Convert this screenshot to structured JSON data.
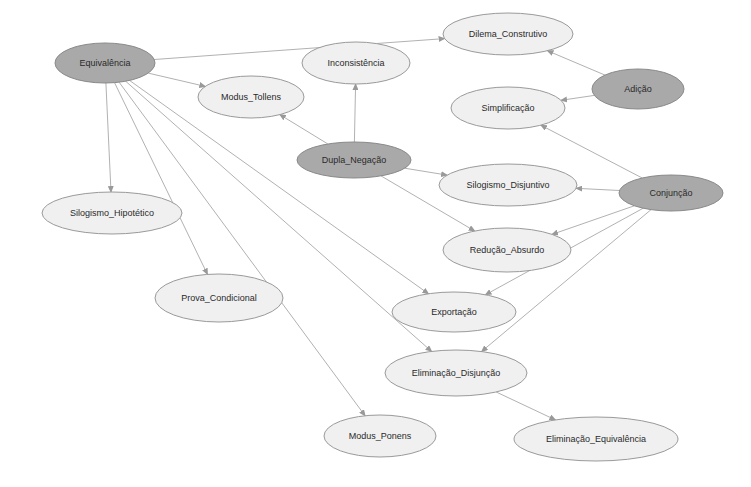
{
  "diagram": {
    "type": "directed-graph",
    "colors": {
      "central_node_fill": "#a9a9a9",
      "leaf_node_fill": "#f0f0f0",
      "edge": "#a8a8a8",
      "label": "#2a2a2a"
    },
    "nodes": [
      {
        "id": "equivalencia",
        "label": "Equivalência",
        "cx": 105,
        "cy": 63,
        "rx": 50,
        "ry": 20,
        "style": "dark"
      },
      {
        "id": "dilema_construtivo",
        "label": "Dilema_Construtivo",
        "cx": 508,
        "cy": 34,
        "rx": 65,
        "ry": 21,
        "style": "light"
      },
      {
        "id": "inconsistencia",
        "label": "Inconsistência",
        "cx": 356,
        "cy": 63,
        "rx": 54,
        "ry": 21,
        "style": "light"
      },
      {
        "id": "modus_tollens",
        "label": "Modus_Tollens",
        "cx": 251,
        "cy": 97,
        "rx": 53,
        "ry": 21,
        "style": "light"
      },
      {
        "id": "adicao",
        "label": "Adição",
        "cx": 638,
        "cy": 89,
        "rx": 46,
        "ry": 20,
        "style": "dark"
      },
      {
        "id": "simplificacao",
        "label": "Simplificação",
        "cx": 508,
        "cy": 108,
        "rx": 57,
        "ry": 21,
        "style": "light"
      },
      {
        "id": "dupla_negacao",
        "label": "Dupla_Negação",
        "cx": 354,
        "cy": 160,
        "rx": 57,
        "ry": 18,
        "style": "dark"
      },
      {
        "id": "silogismo_disjuntivo",
        "label": "Silogismo_Disjuntivo",
        "cx": 508,
        "cy": 185,
        "rx": 69,
        "ry": 21,
        "style": "light"
      },
      {
        "id": "conjuncao",
        "label": "Conjunção",
        "cx": 671,
        "cy": 193,
        "rx": 52,
        "ry": 18,
        "style": "dark"
      },
      {
        "id": "silogismo_hipotetico",
        "label": "Silogismo_Hipotético",
        "cx": 112,
        "cy": 213,
        "rx": 70,
        "ry": 21,
        "style": "light"
      },
      {
        "id": "reducao_absurdo",
        "label": "Redução_Absurdo",
        "cx": 507,
        "cy": 250,
        "rx": 64,
        "ry": 22,
        "style": "light"
      },
      {
        "id": "prova_condicional",
        "label": "Prova_Condicional",
        "cx": 219,
        "cy": 298,
        "rx": 64,
        "ry": 24,
        "style": "light"
      },
      {
        "id": "exportacao",
        "label": "Exportação",
        "cx": 454,
        "cy": 312,
        "rx": 62,
        "ry": 20,
        "style": "light"
      },
      {
        "id": "eliminacao_disjuncao",
        "label": "Eliminação_Disjunção",
        "cx": 456,
        "cy": 373,
        "rx": 71,
        "ry": 23,
        "style": "light"
      },
      {
        "id": "modus_ponens",
        "label": "Modus_Ponens",
        "cx": 380,
        "cy": 436,
        "rx": 56,
        "ry": 21,
        "style": "light"
      },
      {
        "id": "eliminacao_equivalencia",
        "label": "Eliminação_Equivalência",
        "cx": 596,
        "cy": 439,
        "rx": 82,
        "ry": 22,
        "style": "light"
      }
    ],
    "edges": [
      {
        "from": "equivalencia",
        "to": "dilema_construtivo"
      },
      {
        "from": "equivalencia",
        "to": "modus_tollens"
      },
      {
        "from": "equivalencia",
        "to": "silogismo_hipotetico"
      },
      {
        "from": "equivalencia",
        "to": "prova_condicional"
      },
      {
        "from": "equivalencia",
        "to": "modus_ponens"
      },
      {
        "from": "equivalencia",
        "to": "eliminacao_disjuncao"
      },
      {
        "from": "equivalencia",
        "to": "exportacao"
      },
      {
        "from": "adicao",
        "to": "dilema_construtivo"
      },
      {
        "from": "adicao",
        "to": "simplificacao"
      },
      {
        "from": "dupla_negacao",
        "to": "inconsistencia"
      },
      {
        "from": "dupla_negacao",
        "to": "modus_tollens"
      },
      {
        "from": "dupla_negacao",
        "to": "silogismo_disjuntivo"
      },
      {
        "from": "dupla_negacao",
        "to": "reducao_absurdo"
      },
      {
        "from": "conjuncao",
        "to": "simplificacao"
      },
      {
        "from": "conjuncao",
        "to": "silogismo_disjuntivo"
      },
      {
        "from": "conjuncao",
        "to": "reducao_absurdo"
      },
      {
        "from": "conjuncao",
        "to": "exportacao"
      },
      {
        "from": "conjuncao",
        "to": "eliminacao_disjuncao"
      },
      {
        "from": "eliminacao_disjuncao",
        "to": "eliminacao_equivalencia"
      }
    ]
  }
}
